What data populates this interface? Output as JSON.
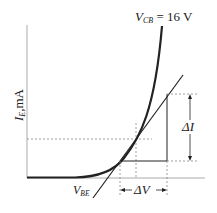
{
  "diagram": {
    "title_label": "V",
    "title_sub": "CB",
    "title_rest": " = 16 V",
    "y_axis_label": "I",
    "y_axis_sub": "E",
    "y_axis_rest": ",mA",
    "tangent_label": "V",
    "tangent_sub": "BE",
    "delta_i_label": "ΔI",
    "delta_v_label": "ΔV"
  },
  "colors": {
    "curve": "#222222",
    "axis": "#999999",
    "dashed": "#888888"
  }
}
